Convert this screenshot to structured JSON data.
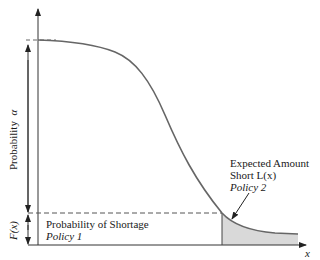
{
  "diagram": {
    "axis_x_label": "x",
    "y_left_label": "Probability",
    "y_left_symbol": "α",
    "fx_label": "F(x)",
    "shortage_label_line1": "Probability of Shortage",
    "shortage_label_line2": "Policy 1",
    "expected_label_line1": "Expected Amount",
    "expected_label_line2": "Short L(x)",
    "expected_label_line3": "Policy 2",
    "colors": {
      "curve": "#666666",
      "axes": "#333333",
      "shade": "#d9d9d9",
      "text": "#1a1a1a"
    }
  }
}
